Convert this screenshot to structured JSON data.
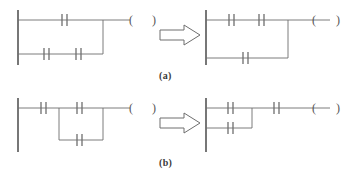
{
  "figure": {
    "stroke_color": "#6e6e6e",
    "rail_color": "#555555",
    "background": "#ffffff",
    "captions": [
      {
        "id": "caption-a",
        "text": "(a)"
      },
      {
        "id": "caption-b",
        "text": "(b)"
      }
    ],
    "arrow_symbol": "hollow-right-arrow",
    "coil_open_paren": "(",
    "coil_close_paren": ")"
  },
  "rows": [
    {
      "id": "row-a",
      "caption": "(a)",
      "before": {
        "id": "ladder-a-before",
        "description": "Top branch with one contact, bottom branch with two contacts, merged to output coil",
        "branches": [
          {
            "id": "a-before-branch-top",
            "contacts": 1
          },
          {
            "id": "a-before-branch-bottom",
            "contacts": 2
          }
        ],
        "coil": {
          "open": "(",
          "close": ")"
        }
      },
      "after": {
        "id": "ladder-a-after",
        "description": "Top branch with two contacts, bottom branch with one contact, merged to output coil",
        "branches": [
          {
            "id": "a-after-branch-top",
            "contacts": 2
          },
          {
            "id": "a-after-branch-bottom",
            "contacts": 1
          }
        ],
        "coil": {
          "open": "(",
          "close": ")"
        }
      }
    },
    {
      "id": "row-b",
      "caption": "(b)",
      "before": {
        "id": "ladder-b-before",
        "description": "One series contact followed by a parallel block of two single-contact branches, then output coil",
        "series_contacts_before_block": 1,
        "branches": [
          {
            "id": "b-before-branch-top",
            "contacts": 1
          },
          {
            "id": "b-before-branch-bottom",
            "contacts": 1
          }
        ],
        "series_contacts_after_block": 0,
        "coil": {
          "open": "(",
          "close": ")"
        }
      },
      "after": {
        "id": "ladder-b-after",
        "description": "Parallel block of two single-contact branches followed by one series contact, then output coil",
        "series_contacts_before_block": 0,
        "branches": [
          {
            "id": "b-after-branch-top",
            "contacts": 1
          },
          {
            "id": "b-after-branch-bottom",
            "contacts": 1
          }
        ],
        "series_contacts_after_block": 1,
        "coil": {
          "open": "(",
          "close": ")"
        }
      }
    }
  ]
}
